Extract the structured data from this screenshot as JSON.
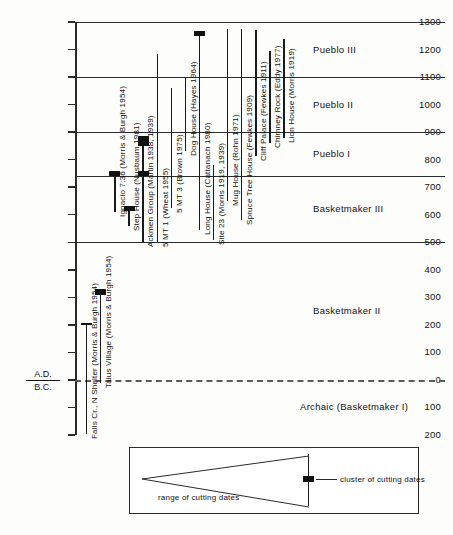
{
  "chart_data": {
    "type": "bar",
    "xlabel": "",
    "ylabel": "",
    "orientation": "vertical-ranges",
    "axis": {
      "ticks": [
        1300,
        1200,
        1100,
        1000,
        900,
        800,
        700,
        600,
        500,
        400,
        300,
        200,
        100,
        0,
        100,
        200
      ],
      "tick_labels": [
        "1300",
        "1200",
        "1100",
        "1000",
        "900",
        "800",
        "700",
        "600",
        "500",
        "400",
        "300",
        "200",
        "100",
        "0",
        "100",
        "200"
      ],
      "zero_label_top": "A.D.",
      "zero_label_bottom": "B.C.",
      "ylim": [
        -200,
        1300
      ],
      "grid": "period-dividers-only"
    },
    "periods": [
      {
        "label": "Pueblo III",
        "start": 1100,
        "end": 1300
      },
      {
        "label": "Pueblo II",
        "start": 900,
        "end": 1100
      },
      {
        "label": "Pueblo I",
        "start": 740,
        "end": 900
      },
      {
        "label": "Basketmaker III",
        "start": 500,
        "end": 740
      },
      {
        "label": "Basketmaker II",
        "start": 0,
        "end": 500
      },
      {
        "label": "Archaic  (Basketmaker I)",
        "start": -200,
        "end": 0
      }
    ],
    "series": [
      {
        "name": "Falls Cr., N Shelter",
        "label": "Falls Cr., N Shelter  (Morris & Burgh 1954)",
        "range": [
          -195,
          205
        ],
        "cluster": null,
        "cross": 205
      },
      {
        "name": "Talus Village",
        "label": "Talus Village  (Morris & Burgh 1954)",
        "range": [
          -10,
          320
        ],
        "cluster": 320,
        "cross": null
      },
      {
        "name": "Ignacio 7:36",
        "label": "Ignacio 7:36 (Morris & Burgh 1954)",
        "range": [
          610,
          755
        ],
        "cluster": 750,
        "cross": null
      },
      {
        "name": "Step House",
        "label": "Step House (Nusbaum 1981)",
        "range": [
          560,
          625
        ],
        "cluster": 622,
        "cross": null
      },
      {
        "name": "Ackmen Group",
        "label": "Ackmen Group (Martin 1938, 1939)",
        "range": [
          500,
          880
        ],
        "cluster": 860,
        "cross": null
      },
      {
        "name": "5 MT 1",
        "label": "5 MT 1  (Wheat 1955)",
        "range": [
          500,
          1185
        ],
        "cluster": null,
        "cross": null
      },
      {
        "name": "5 MT 3",
        "label": "5 MT 3  (Brown 1975)",
        "range": [
          625,
          1060
        ],
        "cluster": null,
        "cross": null
      },
      {
        "name": "Dog House",
        "label": "Dog House (Hayes 1964)",
        "range": [
          830,
          1100
        ],
        "cluster": null,
        "cross": null
      },
      {
        "name": "Long House",
        "label": "Long House (Cattanach 1980)",
        "range": [
          545,
          1260
        ],
        "cluster": 1258,
        "cross": null
      },
      {
        "name": "Site 23",
        "label": "Site 23  (Morris 1919, 1939)",
        "range": [
          510,
          780
        ],
        "cluster": null,
        "cross": null
      },
      {
        "name": "Mug House",
        "label": "Mug House (Rohn 1971)",
        "range": [
          650,
          1275
        ],
        "cluster": null,
        "cross": null
      },
      {
        "name": "Spruce Tree House",
        "label": "Spruce Tree House (Fewkes 1909)",
        "range": [
          580,
          1275
        ],
        "cluster": null,
        "cross": null
      },
      {
        "name": "Cliff Palace",
        "label": "Cliff Palace (Fewkes 1911)",
        "range": [
          815,
          1270
        ],
        "cluster": null,
        "cross": null
      },
      {
        "name": "Chimney Rock",
        "label": "Chimney Rock (Eddy 1977)",
        "range": [
          860,
          1195
        ],
        "cluster": null,
        "cross": null
      },
      {
        "name": "Lion House",
        "label": "Lion House  (Morris 1919)",
        "range": [
          880,
          1240
        ],
        "cluster": null,
        "cross": null
      }
    ]
  },
  "legend": {
    "range_text": "range of cutting dates",
    "cluster_text": "cluster of cutting dates"
  }
}
